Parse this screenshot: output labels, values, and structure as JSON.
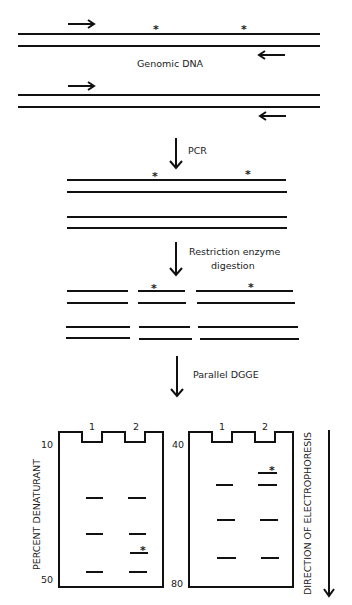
{
  "diagram": {
    "stages": [
      {
        "id": "genomic",
        "label": "Genomic DNA"
      },
      {
        "id": "pcr",
        "label": "PCR"
      },
      {
        "id": "digest",
        "label_line1": "Restriction enzyme",
        "label_line2": "digestion"
      },
      {
        "id": "dgge",
        "label": "Parallel DGGE"
      }
    ],
    "mutation_marker": "*",
    "gels": [
      {
        "id": "gel-left",
        "top_percent": "10",
        "bottom_percent": "50",
        "lanes": [
          "1",
          "2"
        ]
      },
      {
        "id": "gel-right",
        "top_percent": "40",
        "bottom_percent": "80",
        "lanes": [
          "1",
          "2"
        ]
      }
    ],
    "y_axis_label": "PERCENT DENATURANT",
    "direction_label": "DIRECTION OF ELECTROPHORESIS"
  }
}
